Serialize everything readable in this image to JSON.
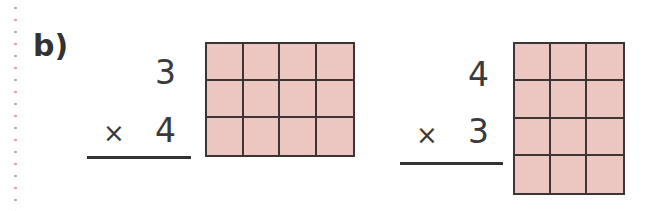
{
  "section_label": "b)",
  "problems": [
    {
      "top": "3",
      "operator": "×",
      "bottom": "4",
      "grid": {
        "columns": 4,
        "rows": 3
      }
    },
    {
      "top": "4",
      "operator": "×",
      "bottom": "3",
      "grid": {
        "columns": 3,
        "rows": 4
      }
    }
  ],
  "colors": {
    "grid_fill": "#ecc7c1",
    "grid_line": "#3d3434",
    "margin_dots": "#d9a8ad"
  }
}
